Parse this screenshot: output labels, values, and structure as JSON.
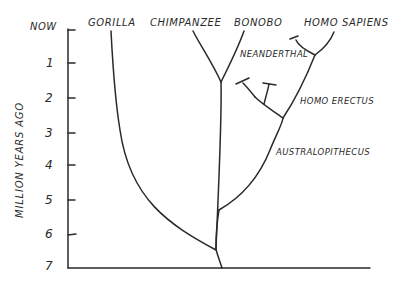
{
  "diagram": {
    "title": "",
    "axis": {
      "label": "MILLION YEARS AGO",
      "ticks": [
        "NOW",
        "1",
        "2",
        "3",
        "4",
        "5",
        "6",
        "7"
      ]
    },
    "species": {
      "gorilla": "GORILLA",
      "chimpanzee": "CHIMPANZEE",
      "bonobo": "BONOBO",
      "homo_sapiens": "HOMO SAPIENS",
      "neanderthal": "NEANDERTHAL",
      "homo_erectus": "HOMO ERECTUS",
      "australopithecus": "AUSTRALOPITHECUS"
    },
    "colors": {
      "ink": "#2a2a2a",
      "background": "#ffffff"
    }
  }
}
